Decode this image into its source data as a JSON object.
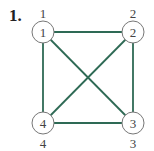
{
  "problem_number": "1.",
  "graph": {
    "edge_color": "#2e6a55",
    "nodes": [
      {
        "id": "1",
        "label": "1",
        "outer_label": "1",
        "cx": 43,
        "cy": 32,
        "lx": 43,
        "ly": 13
      },
      {
        "id": "2",
        "label": "2",
        "outer_label": "2",
        "cx": 133,
        "cy": 32,
        "lx": 133,
        "ly": 13
      },
      {
        "id": "3",
        "label": "3",
        "outer_label": "3",
        "cx": 133,
        "cy": 123,
        "lx": 133,
        "ly": 143
      },
      {
        "id": "4",
        "label": "4",
        "outer_label": "4",
        "cx": 43,
        "cy": 123,
        "lx": 43,
        "ly": 143
      }
    ],
    "edges": [
      [
        "1",
        "2"
      ],
      [
        "2",
        "3"
      ],
      [
        "3",
        "4"
      ],
      [
        "4",
        "1"
      ],
      [
        "1",
        "3"
      ],
      [
        "2",
        "4"
      ]
    ]
  }
}
